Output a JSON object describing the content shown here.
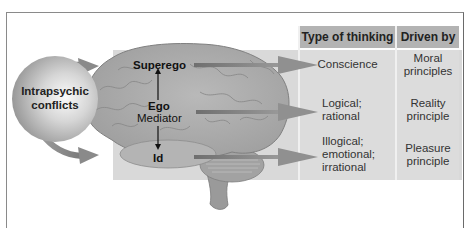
{
  "diagram": {
    "title": "",
    "source_label": "Intrapsychic conflicts",
    "source_label_lines": [
      "Intrapsychic",
      "conflicts"
    ],
    "brain_labels": {
      "superego": "Superego",
      "ego": "Ego",
      "ego_role": "Mediator",
      "id": "Id"
    },
    "table": {
      "headers": [
        "Type of thinking",
        "Driven by"
      ],
      "rows": [
        {
          "component": "Superego",
          "type_of_thinking": [
            "Conscience"
          ],
          "driven_by": [
            "Moral",
            "principles"
          ]
        },
        {
          "component": "Ego",
          "type_of_thinking": [
            "Logical;",
            "rational"
          ],
          "driven_by": [
            "Reality",
            "principle"
          ]
        },
        {
          "component": "Id",
          "type_of_thinking": [
            "Illogical;",
            "emotional;",
            "irrational"
          ],
          "driven_by": [
            "Pleasure",
            "principle"
          ]
        }
      ]
    },
    "colors": {
      "panel": "#d9d9d9",
      "header": "#b3b3b3",
      "arrow": "#8c8c8c",
      "brain": "#a9a9a9",
      "frame": "#8a8a8a"
    }
  }
}
